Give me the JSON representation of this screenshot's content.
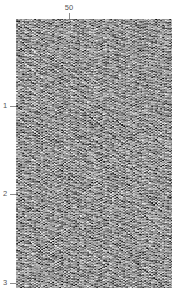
{
  "figure": {
    "title": "",
    "background_color": "#ffffff",
    "width": 178,
    "height": 296
  },
  "top_axis": {
    "name": "trace-number-axis",
    "position": "top",
    "ticks": [
      {
        "label": "50",
        "value": 50,
        "x_px": 69
      }
    ]
  },
  "left_axis": {
    "name": "time-axis",
    "position": "left",
    "ticks": [
      {
        "label": "1",
        "value": 1,
        "y_px": 106
      },
      {
        "label": "2",
        "value": 2,
        "y_px": 194
      },
      {
        "label": "3",
        "value": 3,
        "y_px": 283
      }
    ]
  },
  "plot": {
    "name": "seismic-section-panel",
    "left_px": 16,
    "top_px": 19,
    "width_px": 156,
    "height_px": 269,
    "colors": {
      "peak": "#000000",
      "trough": "#ffffff",
      "background": "#9a9a9a",
      "axis": "#8d8d8d",
      "text": "#555555"
    }
  },
  "chart_data": {
    "type": "heatmap",
    "title": "",
    "subtitle": "",
    "xlabel": "",
    "ylabel": "",
    "xlim": [
      0,
      88
    ],
    "ylim": [
      0,
      3.05
    ],
    "grid": false,
    "legend": null,
    "x_tick_labels": [
      "50"
    ],
    "x_tick_values": [
      50
    ],
    "y_tick_labels": [
      "1",
      "2",
      "3"
    ],
    "y_tick_values": [
      1,
      2,
      3
    ],
    "render_params": {
      "n_traces": 88,
      "n_samples": 269,
      "trace_spacing_px": 1.773,
      "seed": 20240517,
      "contrast": 2.2,
      "clip": 1.0,
      "events": [
        {
          "kind": "linear",
          "t0": 0.02,
          "dip": 0.0155,
          "freq": 0.52,
          "amp": 0.95,
          "phase": 0.0
        },
        {
          "kind": "linear",
          "t0": 0.1,
          "dip": 0.0163,
          "freq": 0.5,
          "amp": 0.9,
          "phase": 1.1
        },
        {
          "kind": "linear",
          "t0": 0.2,
          "dip": 0.017,
          "freq": 0.49,
          "amp": 1.0,
          "phase": 2.2
        },
        {
          "kind": "linear",
          "t0": 0.31,
          "dip": 0.0158,
          "freq": 0.53,
          "amp": 0.85,
          "phase": 0.6
        },
        {
          "kind": "linear",
          "t0": 0.43,
          "dip": 0.0166,
          "freq": 0.47,
          "amp": 1.0,
          "phase": 3.0
        },
        {
          "kind": "linear",
          "t0": 0.55,
          "dip": 0.0172,
          "freq": 0.51,
          "amp": 0.92,
          "phase": 1.8
        },
        {
          "kind": "linear",
          "t0": 0.68,
          "dip": 0.016,
          "freq": 0.48,
          "amp": 0.88,
          "phase": 2.6
        },
        {
          "kind": "linear",
          "t0": 0.82,
          "dip": 0.0168,
          "freq": 0.52,
          "amp": 0.97,
          "phase": 0.4
        },
        {
          "kind": "linear",
          "t0": 0.97,
          "dip": 0.0175,
          "freq": 0.46,
          "amp": 0.9,
          "phase": 1.5
        },
        {
          "kind": "linear",
          "t0": 1.12,
          "dip": 0.0161,
          "freq": 0.5,
          "amp": 0.95,
          "phase": 2.9
        },
        {
          "kind": "linear",
          "t0": 1.28,
          "dip": 0.0169,
          "freq": 0.49,
          "amp": 0.86,
          "phase": 0.9
        },
        {
          "kind": "linear",
          "t0": 1.45,
          "dip": 0.0157,
          "freq": 0.54,
          "amp": 1.0,
          "phase": 2.1
        },
        {
          "kind": "linear",
          "t0": 1.62,
          "dip": 0.0171,
          "freq": 0.47,
          "amp": 0.91,
          "phase": 1.3
        },
        {
          "kind": "linear",
          "t0": 1.8,
          "dip": 0.0164,
          "freq": 0.51,
          "amp": 0.93,
          "phase": 3.1
        },
        {
          "kind": "linear",
          "t0": 1.99,
          "dip": 0.0159,
          "freq": 0.48,
          "amp": 0.89,
          "phase": 0.2
        },
        {
          "kind": "linear",
          "t0": 2.19,
          "dip": 0.0173,
          "freq": 0.52,
          "amp": 0.96,
          "phase": 1.7
        },
        {
          "kind": "linear",
          "t0": 2.4,
          "dip": 0.0162,
          "freq": 0.5,
          "amp": 0.87,
          "phase": 2.4
        },
        {
          "kind": "linear",
          "t0": 2.62,
          "dip": 0.0167,
          "freq": 0.49,
          "amp": 0.94,
          "phase": 0.8
        },
        {
          "kind": "linear-cross",
          "t0": 2.05,
          "dip": -0.015,
          "freq": 0.5,
          "amp": 0.7,
          "phase": 1.0
        },
        {
          "kind": "linear-cross",
          "t0": 2.3,
          "dip": -0.0148,
          "freq": 0.52,
          "amp": 0.68,
          "phase": 2.3
        },
        {
          "kind": "linear-cross",
          "t0": 2.55,
          "dip": -0.0152,
          "freq": 0.48,
          "amp": 0.72,
          "phase": 0.5
        },
        {
          "kind": "linear-cross",
          "t0": 2.8,
          "dip": -0.0146,
          "freq": 0.51,
          "amp": 0.66,
          "phase": 1.9
        }
      ]
    }
  }
}
